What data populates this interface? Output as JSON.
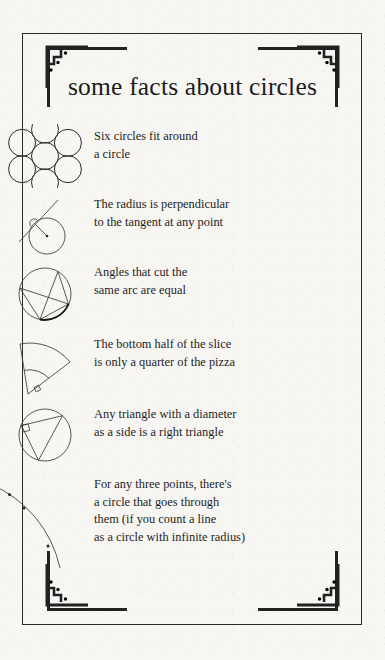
{
  "page": {
    "title": "some facts about circles",
    "background_color": "#f7f6f3",
    "ink_color": "#222222",
    "border_color": "#2b2b2b"
  },
  "ornaments": {
    "corner_top_left": "art-deco-stepped-corner",
    "corner_top_right": "art-deco-stepped-corner",
    "corner_bottom_left": "art-deco-stepped-corner",
    "corner_bottom_right": "art-deco-stepped-corner"
  },
  "facts": [
    {
      "figure": "seven-circles-hexagonal-packing-diagram",
      "lines": [
        "Six circles fit around",
        "a circle"
      ]
    },
    {
      "figure": "tangent-radius-perpendicular-diagram",
      "lines": [
        "The radius is perpendicular",
        "to the tangent at any point"
      ]
    },
    {
      "figure": "inscribed-angles-same-arc-diagram",
      "lines": [
        "Angles that cut the",
        "same arc are equal"
      ]
    },
    {
      "figure": "pizza-slice-sector-halves-diagram",
      "lines": [
        "The bottom half of the slice",
        "is only a quarter of the pizza"
      ]
    },
    {
      "figure": "thales-right-triangle-diameter-diagram",
      "lines": [
        "Any triangle with a diameter",
        "as a side is a right triangle"
      ]
    },
    {
      "figure": "three-points-arc-through-diagram",
      "lines": [
        "For any three points, there's",
        "a circle that goes through",
        "them (if you count a line",
        "as a circle with infinite radius)"
      ]
    }
  ]
}
